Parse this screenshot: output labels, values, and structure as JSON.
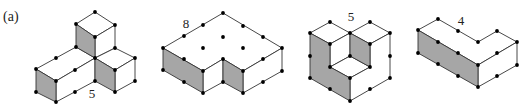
{
  "panel_label": "(a)",
  "colors": {
    "face_shaded": "#a6a6a6",
    "face_plain": "#ffffff",
    "edge": "#333333",
    "vertex": "#000000"
  },
  "figures": [
    {
      "id": "figure-1",
      "label": "5",
      "label_pos": [
        92,
        98
      ],
      "gray_faces": [
        [
          [
            76,
            24
          ],
          [
            95,
            37
          ],
          [
            95,
            58
          ],
          [
            76,
            47
          ]
        ],
        [
          [
            36,
            69
          ],
          [
            56,
            81
          ],
          [
            56,
            102
          ],
          [
            36,
            92
          ]
        ],
        [
          [
            95,
            58
          ],
          [
            115,
            70
          ],
          [
            115,
            92
          ],
          [
            95,
            81
          ]
        ]
      ],
      "white_faces": [
        [
          [
            76,
            24
          ],
          [
            95,
            12
          ],
          [
            115,
            25
          ],
          [
            95,
            37
          ]
        ],
        [
          [
            95,
            37
          ],
          [
            115,
            25
          ],
          [
            115,
            48
          ],
          [
            95,
            58
          ]
        ],
        [
          [
            36,
            69
          ],
          [
            76,
            47
          ],
          [
            95,
            58
          ],
          [
            56,
            81
          ]
        ],
        [
          [
            56,
            81
          ],
          [
            95,
            58
          ],
          [
            95,
            81
          ],
          [
            56,
            102
          ]
        ],
        [
          [
            95,
            58
          ],
          [
            115,
            48
          ],
          [
            135,
            58
          ],
          [
            115,
            70
          ]
        ],
        [
          [
            115,
            70
          ],
          [
            135,
            58
          ],
          [
            135,
            81
          ],
          [
            115,
            92
          ]
        ]
      ],
      "vertices": [
        [
          95,
          12
        ],
        [
          76,
          24
        ],
        [
          115,
          25
        ],
        [
          95,
          37
        ],
        [
          115,
          48
        ],
        [
          95,
          58
        ],
        [
          56,
          58
        ],
        [
          36,
          69
        ],
        [
          76,
          47
        ],
        [
          75,
          70
        ],
        [
          56,
          81
        ],
        [
          36,
          92
        ],
        [
          56,
          102
        ],
        [
          75,
          92
        ],
        [
          95,
          81
        ],
        [
          115,
          70
        ],
        [
          135,
          58
        ],
        [
          115,
          92
        ],
        [
          135,
          81
        ]
      ]
    },
    {
      "id": "figure-2",
      "label": "8",
      "label_pos": [
        186,
        28
      ],
      "gray_faces": [
        [
          [
            163,
            48
          ],
          [
            203,
            71
          ],
          [
            203,
            93
          ],
          [
            163,
            70
          ]
        ],
        [
          [
            223,
            59
          ],
          [
            243,
            71
          ],
          [
            243,
            93
          ],
          [
            223,
            82
          ]
        ]
      ],
      "white_faces": [
        [
          [
            163,
            48
          ],
          [
            223,
            13
          ],
          [
            282,
            48
          ],
          [
            243,
            71
          ],
          [
            223,
            59
          ],
          [
            203,
            71
          ]
        ],
        [
          [
            203,
            71
          ],
          [
            223,
            59
          ],
          [
            223,
            82
          ],
          [
            203,
            93
          ]
        ],
        [
          [
            243,
            71
          ],
          [
            282,
            48
          ],
          [
            282,
            71
          ],
          [
            243,
            93
          ]
        ]
      ],
      "vertices": [
        [
          223,
          13
        ],
        [
          203,
          25
        ],
        [
          184,
          36
        ],
        [
          163,
          48
        ],
        [
          243,
          26
        ],
        [
          263,
          37
        ],
        [
          282,
          48
        ],
        [
          223,
          37
        ],
        [
          203,
          48
        ],
        [
          243,
          48
        ],
        [
          184,
          59
        ],
        [
          203,
          71
        ],
        [
          223,
          59
        ],
        [
          243,
          71
        ],
        [
          263,
          59
        ],
        [
          163,
          70
        ],
        [
          184,
          82
        ],
        [
          203,
          93
        ],
        [
          223,
          82
        ],
        [
          243,
          93
        ],
        [
          263,
          82
        ],
        [
          282,
          71
        ]
      ]
    },
    {
      "id": "figure-3",
      "label": "5",
      "label_pos": [
        351,
        21
      ],
      "gray_faces": [
        [
          [
            310,
            33
          ],
          [
            330,
            44
          ],
          [
            330,
            67
          ],
          [
            350,
            78
          ],
          [
            350,
            101
          ],
          [
            310,
            78
          ]
        ],
        [
          [
            350,
            33
          ],
          [
            370,
            44
          ],
          [
            370,
            67
          ],
          [
            350,
            56
          ]
        ]
      ],
      "white_faces": [
        [
          [
            310,
            33
          ],
          [
            330,
            22
          ],
          [
            350,
            33
          ],
          [
            330,
            44
          ]
        ],
        [
          [
            350,
            33
          ],
          [
            370,
            22
          ],
          [
            390,
            33
          ],
          [
            370,
            44
          ]
        ],
        [
          [
            330,
            44
          ],
          [
            350,
            33
          ],
          [
            350,
            56
          ],
          [
            330,
            67
          ]
        ],
        [
          [
            330,
            67
          ],
          [
            350,
            56
          ],
          [
            370,
            67
          ],
          [
            350,
            78
          ]
        ],
        [
          [
            350,
            78
          ],
          [
            370,
            67
          ],
          [
            370,
            44
          ],
          [
            390,
            33
          ],
          [
            390,
            78
          ],
          [
            350,
            101
          ]
        ]
      ],
      "vertices": [
        [
          330,
          22
        ],
        [
          310,
          33
        ],
        [
          350,
          33
        ],
        [
          370,
          22
        ],
        [
          390,
          33
        ],
        [
          330,
          44
        ],
        [
          370,
          44
        ],
        [
          310,
          56
        ],
        [
          350,
          56
        ],
        [
          390,
          56
        ],
        [
          330,
          67
        ],
        [
          370,
          67
        ],
        [
          310,
          78
        ],
        [
          350,
          78
        ],
        [
          390,
          78
        ],
        [
          330,
          89
        ],
        [
          370,
          89
        ],
        [
          350,
          101
        ]
      ]
    },
    {
      "id": "figure-4",
      "label": "4",
      "label_pos": [
        461,
        25
      ],
      "gray_faces": [
        [
          [
            418,
            30
          ],
          [
            478,
            65
          ],
          [
            478,
            87
          ],
          [
            418,
            53
          ]
        ]
      ],
      "white_faces": [
        [
          [
            418,
            30
          ],
          [
            438,
            19
          ],
          [
            478,
            42
          ],
          [
            497,
            31
          ],
          [
            517,
            42
          ],
          [
            478,
            65
          ]
        ],
        [
          [
            478,
            65
          ],
          [
            517,
            42
          ],
          [
            517,
            65
          ],
          [
            478,
            87
          ]
        ]
      ],
      "vertices": [
        [
          438,
          19
        ],
        [
          418,
          30
        ],
        [
          458,
          31
        ],
        [
          478,
          42
        ],
        [
          497,
          31
        ],
        [
          517,
          42
        ],
        [
          438,
          42
        ],
        [
          458,
          53
        ],
        [
          478,
          65
        ],
        [
          497,
          53
        ],
        [
          517,
          65
        ],
        [
          418,
          53
        ],
        [
          438,
          64
        ],
        [
          458,
          76
        ],
        [
          478,
          87
        ],
        [
          497,
          76
        ]
      ]
    }
  ]
}
